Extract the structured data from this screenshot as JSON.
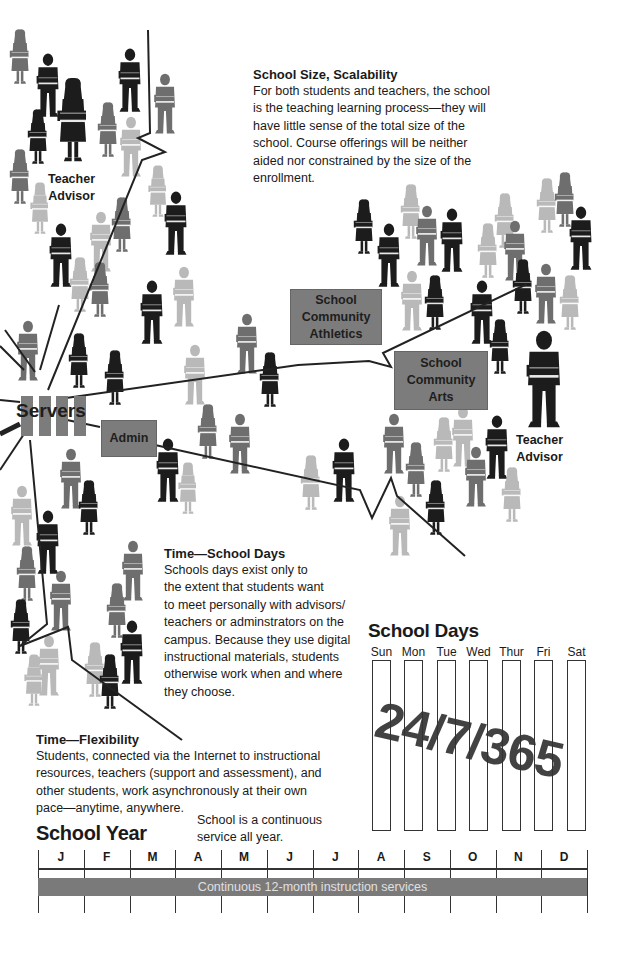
{
  "scalability": {
    "heading": "School Size, Scalability",
    "lines": [
      "For both students and teachers, the school",
      "is the teaching learning process—they will",
      "have little sense of the total size of the",
      "school. Course offerings will be neither",
      "aided nor constrained by the size of the",
      "enrollment."
    ]
  },
  "teacher_advisor_left": {
    "line1": "Teacher",
    "line2": "Advisor"
  },
  "teacher_advisor_right": {
    "line1": "Teacher",
    "line2": "Advisor"
  },
  "servers": {
    "label": "Servers"
  },
  "admin": {
    "label": "Admin"
  },
  "athletics": {
    "line1": "School",
    "line2": "Community",
    "line3": "Athletics"
  },
  "arts": {
    "line1": "School",
    "line2": "Community",
    "line3": "Arts"
  },
  "school_days_text": {
    "heading": "Time—School Days",
    "lines": [
      "Schools days exist only to",
      "the extent that students want",
      "to meet personally with advisors/",
      "teachers or adminstrators on the",
      "campus. Because they use digital",
      "instructional materials, students",
      "otherwise work when and where",
      "they choose."
    ]
  },
  "flexibility": {
    "heading": "Time—Flexibility",
    "lines": [
      "Students, connected via the Internet to instructional",
      "resources, teachers (support and assessment), and",
      "other students, work asynchronously at their own",
      "pace—anytime, anywhere."
    ]
  },
  "school_days_chart": {
    "title": "School Days",
    "days": [
      "Sun",
      "Mon",
      "Tue",
      "Wed",
      "Thur",
      "Fri",
      "Sat"
    ],
    "stamp": "24/7/365"
  },
  "school_year": {
    "title": "School Year",
    "note_line1": "School is a continuous",
    "note_line2": "service all year.",
    "months": [
      "J",
      "F",
      "M",
      "A",
      "M",
      "J",
      "J",
      "A",
      "S",
      "O",
      "N",
      "D"
    ],
    "bar_label": "Continuous 12-month instruction services"
  },
  "colors": {
    "box_gray": "#7c7c7c",
    "figure_dark": "#1c1c1c",
    "figure_mid": "#6e6e6e",
    "figure_light": "#b9b9b9",
    "line": "#222222"
  },
  "figures": [
    {
      "x": 20,
      "y": 32,
      "s": 0.85,
      "t": "f",
      "c": "mid"
    },
    {
      "x": 48,
      "y": 55,
      "s": 0.95,
      "t": "m",
      "c": "dark"
    },
    {
      "x": 73,
      "y": 82,
      "s": 1.3,
      "t": "f",
      "c": "dark"
    },
    {
      "x": 38,
      "y": 112,
      "s": 0.85,
      "t": "f",
      "c": "dark"
    },
    {
      "x": 108,
      "y": 105,
      "s": 0.85,
      "t": "f",
      "c": "mid"
    },
    {
      "x": 130,
      "y": 50,
      "s": 0.95,
      "t": "m",
      "c": "dark"
    },
    {
      "x": 165,
      "y": 75,
      "s": 0.9,
      "t": "m",
      "c": "mid"
    },
    {
      "x": 131,
      "y": 118,
      "s": 0.9,
      "t": "m",
      "c": "light"
    },
    {
      "x": 20,
      "y": 152,
      "s": 0.85,
      "t": "f",
      "c": "mid"
    },
    {
      "x": 40,
      "y": 185,
      "s": 0.8,
      "t": "f",
      "c": "light"
    },
    {
      "x": 158,
      "y": 168,
      "s": 0.8,
      "t": "f",
      "c": "light"
    },
    {
      "x": 122,
      "y": 200,
      "s": 0.85,
      "t": "f",
      "c": "mid"
    },
    {
      "x": 176,
      "y": 193,
      "s": 0.95,
      "t": "m",
      "c": "dark"
    },
    {
      "x": 61,
      "y": 225,
      "s": 0.95,
      "t": "m",
      "c": "dark"
    },
    {
      "x": 101,
      "y": 213,
      "s": 0.9,
      "t": "m",
      "c": "light"
    },
    {
      "x": 80,
      "y": 260,
      "s": 0.85,
      "t": "f",
      "c": "light"
    },
    {
      "x": 100,
      "y": 265,
      "s": 0.85,
      "t": "f",
      "c": "mid"
    },
    {
      "x": 152,
      "y": 282,
      "s": 0.95,
      "t": "m",
      "c": "dark"
    },
    {
      "x": 184,
      "y": 268,
      "s": 0.9,
      "t": "m",
      "c": "light"
    },
    {
      "x": 28,
      "y": 322,
      "s": 0.9,
      "t": "m",
      "c": "mid"
    },
    {
      "x": 79,
      "y": 336,
      "s": 0.85,
      "t": "f",
      "c": "dark"
    },
    {
      "x": 115,
      "y": 353,
      "s": 0.85,
      "t": "f",
      "c": "dark"
    },
    {
      "x": 195,
      "y": 346,
      "s": 0.9,
      "t": "m",
      "c": "light"
    },
    {
      "x": 247,
      "y": 315,
      "s": 0.9,
      "t": "m",
      "c": "mid"
    },
    {
      "x": 270,
      "y": 355,
      "s": 0.85,
      "t": "f",
      "c": "dark"
    },
    {
      "x": 208,
      "y": 407,
      "s": 0.85,
      "t": "f",
      "c": "mid"
    },
    {
      "x": 240,
      "y": 415,
      "s": 0.9,
      "t": "m",
      "c": "mid"
    },
    {
      "x": 168,
      "y": 440,
      "s": 0.95,
      "t": "m",
      "c": "dark"
    },
    {
      "x": 188,
      "y": 465,
      "s": 0.8,
      "t": "f",
      "c": "light"
    },
    {
      "x": 71,
      "y": 450,
      "s": 0.9,
      "t": "m",
      "c": "mid"
    },
    {
      "x": 89,
      "y": 483,
      "s": 0.85,
      "t": "f",
      "c": "dark"
    },
    {
      "x": 22,
      "y": 487,
      "s": 0.9,
      "t": "m",
      "c": "light"
    },
    {
      "x": 48,
      "y": 512,
      "s": 0.95,
      "t": "m",
      "c": "dark"
    },
    {
      "x": 27,
      "y": 549,
      "s": 0.85,
      "t": "f",
      "c": "mid"
    },
    {
      "x": 61,
      "y": 572,
      "s": 0.9,
      "t": "m",
      "c": "mid"
    },
    {
      "x": 133,
      "y": 542,
      "s": 0.9,
      "t": "m",
      "c": "mid"
    },
    {
      "x": 117,
      "y": 586,
      "s": 0.85,
      "t": "f",
      "c": "mid"
    },
    {
      "x": 21,
      "y": 602,
      "s": 0.85,
      "t": "f",
      "c": "dark"
    },
    {
      "x": 49,
      "y": 637,
      "s": 0.9,
      "t": "m",
      "c": "light"
    },
    {
      "x": 34,
      "y": 657,
      "s": 0.8,
      "t": "f",
      "c": "light"
    },
    {
      "x": 132,
      "y": 622,
      "s": 0.95,
      "t": "m",
      "c": "dark"
    },
    {
      "x": 95,
      "y": 645,
      "s": 0.85,
      "t": "f",
      "c": "light"
    },
    {
      "x": 110,
      "y": 657,
      "s": 0.85,
      "t": "f",
      "c": "dark"
    },
    {
      "x": 311,
      "y": 458,
      "s": 0.85,
      "t": "f",
      "c": "light"
    },
    {
      "x": 344,
      "y": 440,
      "s": 0.95,
      "t": "m",
      "c": "dark"
    },
    {
      "x": 394,
      "y": 415,
      "s": 0.9,
      "t": "m",
      "c": "mid"
    },
    {
      "x": 416,
      "y": 445,
      "s": 0.85,
      "t": "f",
      "c": "mid"
    },
    {
      "x": 400,
      "y": 497,
      "s": 0.9,
      "t": "m",
      "c": "light"
    },
    {
      "x": 436,
      "y": 483,
      "s": 0.85,
      "t": "f",
      "c": "dark"
    },
    {
      "x": 444,
      "y": 420,
      "s": 0.85,
      "t": "f",
      "c": "light"
    },
    {
      "x": 463,
      "y": 408,
      "s": 0.9,
      "t": "m",
      "c": "light"
    },
    {
      "x": 476,
      "y": 448,
      "s": 0.9,
      "t": "m",
      "c": "mid"
    },
    {
      "x": 497,
      "y": 417,
      "s": 0.95,
      "t": "m",
      "c": "dark"
    },
    {
      "x": 512,
      "y": 470,
      "s": 0.85,
      "t": "f",
      "c": "light"
    },
    {
      "x": 364,
      "y": 202,
      "s": 0.85,
      "t": "f",
      "c": "dark"
    },
    {
      "x": 389,
      "y": 225,
      "s": 0.95,
      "t": "m",
      "c": "dark"
    },
    {
      "x": 411,
      "y": 187,
      "s": 0.85,
      "t": "f",
      "c": "light"
    },
    {
      "x": 427,
      "y": 207,
      "s": 0.9,
      "t": "m",
      "c": "mid"
    },
    {
      "x": 452,
      "y": 210,
      "s": 0.95,
      "t": "m",
      "c": "dark"
    },
    {
      "x": 412,
      "y": 272,
      "s": 0.9,
      "t": "m",
      "c": "light"
    },
    {
      "x": 435,
      "y": 278,
      "s": 0.85,
      "t": "f",
      "c": "dark"
    },
    {
      "x": 482,
      "y": 282,
      "s": 0.95,
      "t": "m",
      "c": "dark"
    },
    {
      "x": 488,
      "y": 226,
      "s": 0.85,
      "t": "f",
      "c": "light"
    },
    {
      "x": 505,
      "y": 196,
      "s": 0.85,
      "t": "f",
      "c": "light"
    },
    {
      "x": 515,
      "y": 222,
      "s": 0.9,
      "t": "m",
      "c": "mid"
    },
    {
      "x": 523,
      "y": 262,
      "s": 0.85,
      "t": "f",
      "c": "dark"
    },
    {
      "x": 546,
      "y": 265,
      "s": 0.9,
      "t": "m",
      "c": "mid"
    },
    {
      "x": 547,
      "y": 181,
      "s": 0.85,
      "t": "f",
      "c": "light"
    },
    {
      "x": 565,
      "y": 175,
      "s": 0.85,
      "t": "f",
      "c": "mid"
    },
    {
      "x": 581,
      "y": 208,
      "s": 0.95,
      "t": "m",
      "c": "dark"
    },
    {
      "x": 570,
      "y": 278,
      "s": 0.85,
      "t": "f",
      "c": "light"
    },
    {
      "x": 500,
      "y": 322,
      "s": 0.85,
      "t": "f",
      "c": "dark"
    },
    {
      "x": 544,
      "y": 333,
      "s": 1.45,
      "t": "m",
      "c": "dark"
    }
  ]
}
